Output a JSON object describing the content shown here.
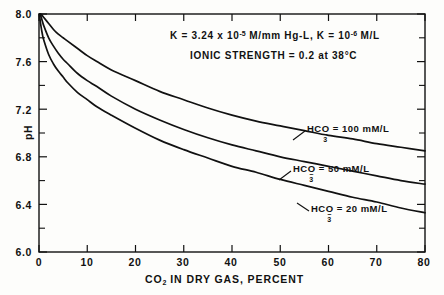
{
  "figure": {
    "background_color": "#fdfdfb",
    "line_color": "#111111",
    "axis_color": "#111111"
  },
  "annotations": {
    "line1_pre": "K = 3.24 x 10",
    "line1_sup": "-5",
    "line1_mid": " M/mm Hg-L,  K = 10",
    "line1_sup2": "-6",
    "line1_post": " M/L",
    "line2": "IONIC STRENGTH = 0.2 at 38°C"
  },
  "axes": {
    "ylabel": "pH",
    "xlabel_pre": "CO",
    "xlabel_sub": "2",
    "xlabel_post": " IN DRY GAS, PERCENT",
    "ytick_labels": [
      "8.0",
      "7.6",
      "7.2",
      "6.8",
      "6.4",
      "6.0"
    ],
    "xtick_labels": [
      "0",
      "10",
      "20",
      "30",
      "40",
      "50",
      "60",
      "70",
      "80"
    ]
  },
  "curve_labels": [
    {
      "pre": "HCO",
      "sub": "3",
      "sup": "−",
      "post": " = 100 mM/L"
    },
    {
      "pre": "HCO",
      "sub": "3",
      "sup": "−",
      "post": " = 50  mM/L"
    },
    {
      "pre": "HCO",
      "sub": "3",
      "sup": "−",
      "post": " = 20 mM/L"
    }
  ],
  "chart_data": {
    "type": "line",
    "title": "",
    "xlabel": "CO2 IN DRY GAS, PERCENT",
    "ylabel": "pH",
    "xlim": [
      0,
      80
    ],
    "ylim": [
      6.0,
      8.0
    ],
    "xticks": [
      0,
      10,
      20,
      30,
      40,
      50,
      60,
      70,
      80
    ],
    "yticks": [
      6.0,
      6.4,
      6.8,
      7.2,
      7.6,
      8.0
    ],
    "minor_yticks": [
      6.2,
      6.6,
      7.0,
      7.4,
      7.8
    ],
    "grid": false,
    "legend": "inline-labels",
    "conditions": {
      "K1": "3.24e-5 M/mm Hg-L",
      "K2": "1e-6 M/L",
      "ionic_strength": 0.2,
      "temperature_C": 38
    },
    "series": [
      {
        "name": "HCO3- = 100 mM/L",
        "x": [
          0.3,
          0.6,
          1,
          2,
          3,
          4,
          5,
          6,
          8,
          10,
          12,
          15,
          20,
          25,
          30,
          35,
          40,
          45,
          50,
          55,
          60,
          65,
          70,
          75,
          80
        ],
        "y": [
          8.0,
          7.99,
          7.97,
          7.92,
          7.87,
          7.83,
          7.8,
          7.77,
          7.71,
          7.65,
          7.6,
          7.53,
          7.44,
          7.35,
          7.28,
          7.21,
          7.15,
          7.1,
          7.06,
          7.02,
          6.98,
          6.95,
          6.91,
          6.88,
          6.85
        ]
      },
      {
        "name": "HCO3- = 50 mM/L",
        "x": [
          0.2,
          0.4,
          0.7,
          1,
          2,
          3,
          4,
          5,
          6,
          8,
          10,
          12,
          15,
          20,
          25,
          30,
          35,
          40,
          45,
          50,
          55,
          60,
          65,
          70,
          75,
          80
        ],
        "y": [
          8.0,
          7.98,
          7.94,
          7.9,
          7.8,
          7.73,
          7.67,
          7.62,
          7.58,
          7.5,
          7.44,
          7.39,
          7.31,
          7.2,
          7.11,
          7.03,
          6.96,
          6.9,
          6.85,
          6.8,
          6.76,
          6.72,
          6.68,
          6.64,
          6.6,
          6.57
        ]
      },
      {
        "name": "HCO3- = 20 mM/L",
        "x": [
          0.1,
          0.2,
          0.4,
          0.7,
          1,
          2,
          3,
          4,
          5,
          6,
          8,
          10,
          12,
          15,
          20,
          25,
          30,
          35,
          40,
          45,
          50,
          55,
          60,
          65,
          70,
          75,
          80
        ],
        "y": [
          8.0,
          7.96,
          7.9,
          7.83,
          7.78,
          7.66,
          7.58,
          7.52,
          7.47,
          7.42,
          7.34,
          7.28,
          7.22,
          7.15,
          7.04,
          6.94,
          6.86,
          6.79,
          6.72,
          6.67,
          6.61,
          6.56,
          6.51,
          6.46,
          6.42,
          6.37,
          6.33
        ]
      }
    ]
  },
  "geometry": {
    "plot_left": 39,
    "plot_right": 425,
    "plot_top": 14,
    "plot_bottom": 252
  }
}
